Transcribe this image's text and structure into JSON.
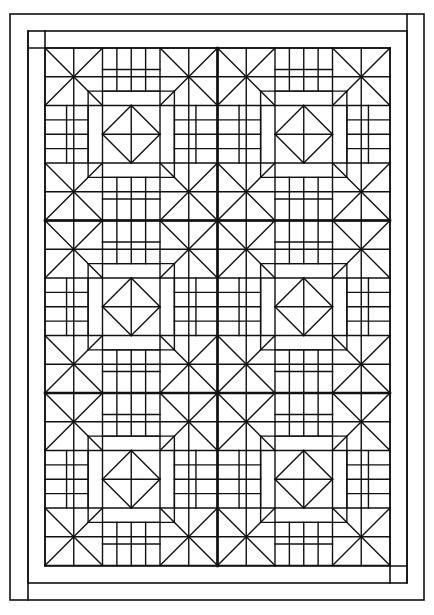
{
  "image": {
    "width": 434,
    "height": 615,
    "background": "#ffffff",
    "stroke": "#111111",
    "description": "Quilt pattern line drawing: 2 x 3 blocks with double border"
  },
  "frame": {
    "outer": {
      "x": 10,
      "y": 14,
      "w": 414,
      "h": 586
    },
    "inner": {
      "x": 28,
      "y": 31,
      "w": 379,
      "h": 552
    },
    "pattern": {
      "x": 45,
      "y": 48,
      "w": 345,
      "h": 518
    }
  },
  "grid": {
    "columns": 2,
    "rows": 3,
    "block_size": 172.5,
    "units_per_block": 12,
    "thick_lines": {
      "x": [
        217.5
      ],
      "y": [
        220.5,
        393
      ]
    }
  },
  "block_lines": [
    [
      0,
      0,
      12,
      0
    ],
    [
      0,
      12,
      12,
      12
    ],
    [
      0,
      0,
      0,
      12
    ],
    [
      12,
      0,
      12,
      12
    ],
    [
      0,
      0,
      4,
      4
    ],
    [
      4,
      0,
      0,
      4
    ],
    [
      8,
      0,
      12,
      4
    ],
    [
      12,
      0,
      8,
      4
    ],
    [
      0,
      8,
      4,
      12
    ],
    [
      4,
      8,
      0,
      12
    ],
    [
      12,
      8,
      8,
      12
    ],
    [
      8,
      8,
      12,
      12
    ],
    [
      2,
      0,
      2,
      4
    ],
    [
      0,
      2,
      4,
      2
    ],
    [
      10,
      0,
      10,
      4
    ],
    [
      8,
      2,
      12,
      2
    ],
    [
      2,
      8,
      2,
      12
    ],
    [
      0,
      10,
      4,
      10
    ],
    [
      10,
      8,
      10,
      12
    ],
    [
      8,
      10,
      12,
      10
    ],
    [
      0,
      4,
      12,
      4
    ],
    [
      0,
      8,
      12,
      8
    ],
    [
      4,
      0,
      4,
      12
    ],
    [
      8,
      0,
      8,
      12
    ],
    [
      4,
      1.5,
      8,
      1.5
    ],
    [
      5,
      0,
      5,
      3
    ],
    [
      6,
      0,
      6,
      3
    ],
    [
      7,
      0,
      7,
      3
    ],
    [
      4,
      3,
      8,
      3
    ],
    [
      4,
      10.5,
      8,
      10.5
    ],
    [
      5,
      9,
      5,
      12
    ],
    [
      6,
      9,
      6,
      12
    ],
    [
      7,
      9,
      7,
      12
    ],
    [
      4,
      9,
      8,
      9
    ],
    [
      1.5,
      4,
      1.5,
      8
    ],
    [
      0,
      5,
      3,
      5
    ],
    [
      0,
      6,
      3,
      6
    ],
    [
      0,
      7,
      3,
      7
    ],
    [
      3,
      4,
      3,
      8
    ],
    [
      10.5,
      4,
      10.5,
      8
    ],
    [
      9,
      5,
      12,
      5
    ],
    [
      9,
      6,
      12,
      6
    ],
    [
      9,
      7,
      12,
      7
    ],
    [
      9,
      4,
      9,
      8
    ],
    [
      6,
      4,
      8,
      6
    ],
    [
      8,
      6,
      6,
      8
    ],
    [
      6,
      8,
      4,
      6
    ],
    [
      4,
      6,
      6,
      4
    ],
    [
      6,
      4,
      6,
      8
    ],
    [
      4,
      6,
      8,
      6
    ],
    [
      3,
      3,
      9,
      3
    ],
    [
      3,
      9,
      9,
      9
    ],
    [
      3,
      3,
      3,
      9
    ],
    [
      9,
      3,
      9,
      9
    ],
    [
      2,
      4,
      2,
      8
    ],
    [
      10,
      4,
      10,
      8
    ],
    [
      4,
      2,
      8,
      2
    ],
    [
      4,
      10,
      8,
      10
    ]
  ]
}
